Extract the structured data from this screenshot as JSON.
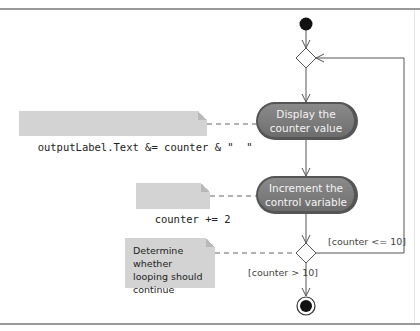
{
  "diagram": {
    "type": "UML activity diagram",
    "notes": {
      "output_statement": "outputLabel.Text &= counter & \"  \"",
      "increment_statement": "counter += 2",
      "decision_comment": [
        "Determine whether",
        "looping should",
        "continue"
      ]
    },
    "actions": {
      "display": [
        "Display the",
        "counter value"
      ],
      "increment": [
        "Increment the",
        "control variable"
      ]
    },
    "guards": {
      "loop_continue": "[counter <= 10]",
      "loop_exit": "[counter > 10]"
    },
    "nodes": [
      "initial-node",
      "merge-node",
      "display-action",
      "increment-action",
      "decision-node",
      "final-node"
    ],
    "colors": {
      "action_fill": "#7f7f7f",
      "action_border": "#555555",
      "note_fill": "#d3d3d3",
      "line": "#555555",
      "frame": "#9a9a9a"
    }
  }
}
